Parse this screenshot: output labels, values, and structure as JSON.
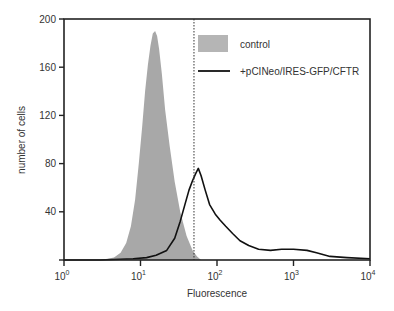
{
  "chart_data": {
    "type": "area",
    "title": "",
    "xlabel": "Fluorescence",
    "ylabel": "number of cells",
    "xscale": "log",
    "xlim": [
      1,
      10000
    ],
    "ylim": [
      0,
      200
    ],
    "x_ticks": [
      {
        "base": "10",
        "exp": "0",
        "value": 1
      },
      {
        "base": "10",
        "exp": "1",
        "value": 10
      },
      {
        "base": "10",
        "exp": "2",
        "value": 100
      },
      {
        "base": "10",
        "exp": "3",
        "value": 1000
      },
      {
        "base": "10",
        "exp": "4",
        "value": 10000
      }
    ],
    "y_ticks": [
      "40",
      "80",
      "120",
      "160",
      "200"
    ],
    "grid": false,
    "legend_position": "upper right",
    "gate_line": {
      "x": 50,
      "style": "dotted"
    },
    "series": [
      {
        "name": "control",
        "style": "filled",
        "color": "#a8a8a8",
        "x": [
          3.0,
          4.5,
          5.5,
          6.5,
          7.5,
          8.5,
          9.5,
          10.5,
          11.5,
          12.5,
          13.5,
          14.5,
          15.5,
          16.5,
          17.5,
          19.0,
          21.0,
          24.0,
          28.0,
          33.0,
          40.0,
          48.0,
          55.0,
          62.0
        ],
        "values": [
          0,
          2,
          6,
          14,
          28,
          50,
          80,
          110,
          140,
          162,
          178,
          188,
          190,
          186,
          175,
          155,
          125,
          95,
          65,
          40,
          20,
          8,
          3,
          0
        ]
      },
      {
        "name": "+pCINeo/IRES-GFP/CFTR",
        "style": "line",
        "color": "#111111",
        "x": [
          1,
          3,
          8,
          12,
          16,
          22,
          28,
          33,
          38,
          43,
          48,
          53,
          57,
          62,
          70,
          80,
          95,
          110,
          130,
          160,
          200,
          260,
          350,
          500,
          700,
          1000,
          1500,
          2000,
          3000,
          5000,
          10000
        ],
        "values": [
          0,
          0,
          1,
          2,
          4,
          8,
          18,
          32,
          46,
          58,
          66,
          72,
          76,
          70,
          58,
          46,
          38,
          33,
          28,
          22,
          16,
          12,
          9,
          8,
          9,
          9,
          8,
          6,
          3,
          2,
          1
        ]
      }
    ]
  },
  "legend": {
    "items": [
      {
        "label": "control",
        "swatch": "filled-box"
      },
      {
        "label": "+pCINeo/IRES-GFP/CFTR",
        "swatch": "line"
      }
    ]
  },
  "axes": {
    "xlabel": "Fluorescence",
    "ylabel": "number of cells"
  }
}
